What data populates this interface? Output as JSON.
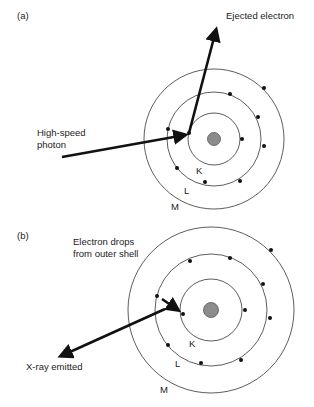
{
  "panel_a": {
    "label": "(a)",
    "ejected_label": "Ejected electron",
    "photon_label_line1": "High-speed",
    "photon_label_line2": "photon",
    "shell_k": "K",
    "shell_l": "L",
    "shell_m": "M"
  },
  "panel_b": {
    "label": "(b)",
    "drop_label_line1": "Electron drops",
    "drop_label_line2": "from outer shell",
    "xray_label": "X-ray emitted",
    "shell_k": "K",
    "shell_l": "L",
    "shell_m": "M"
  },
  "colors": {
    "nucleus": "#8c8c8c",
    "electron": "#111111",
    "shell_line": "#333333"
  }
}
